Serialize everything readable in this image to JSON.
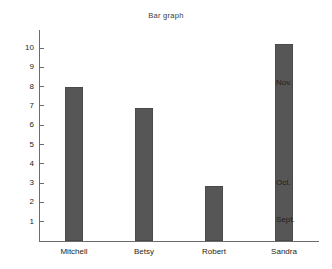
{
  "chart_data": {
    "type": "bar",
    "title": "Bar graph",
    "xlabel": "",
    "ylabel": "",
    "categories": [
      "Mitchell",
      "Betsy",
      "Robert",
      "Sandra"
    ],
    "values": [
      8.0,
      6.9,
      2.85,
      10.2
    ],
    "ylim": [
      0,
      10.6
    ],
    "yticks": [
      1,
      2,
      3,
      4,
      5,
      6,
      7,
      8,
      9,
      10
    ],
    "ytick_labels": [
      "1",
      "2",
      "3",
      "4",
      "5",
      "6",
      "7",
      "8",
      "9",
      "10"
    ],
    "grid": false,
    "legend": null,
    "bar_color": "#565656",
    "axis_color": "#6b6b6b",
    "background": "#ffffff",
    "annotations": [
      {
        "text": "Nov.",
        "value": 8.2
      },
      {
        "text": "Oct.",
        "value": 3.0
      },
      {
        "text": "Sept.",
        "value": 1.1
      }
    ]
  },
  "chart": {
    "title": "Bar graph"
  }
}
